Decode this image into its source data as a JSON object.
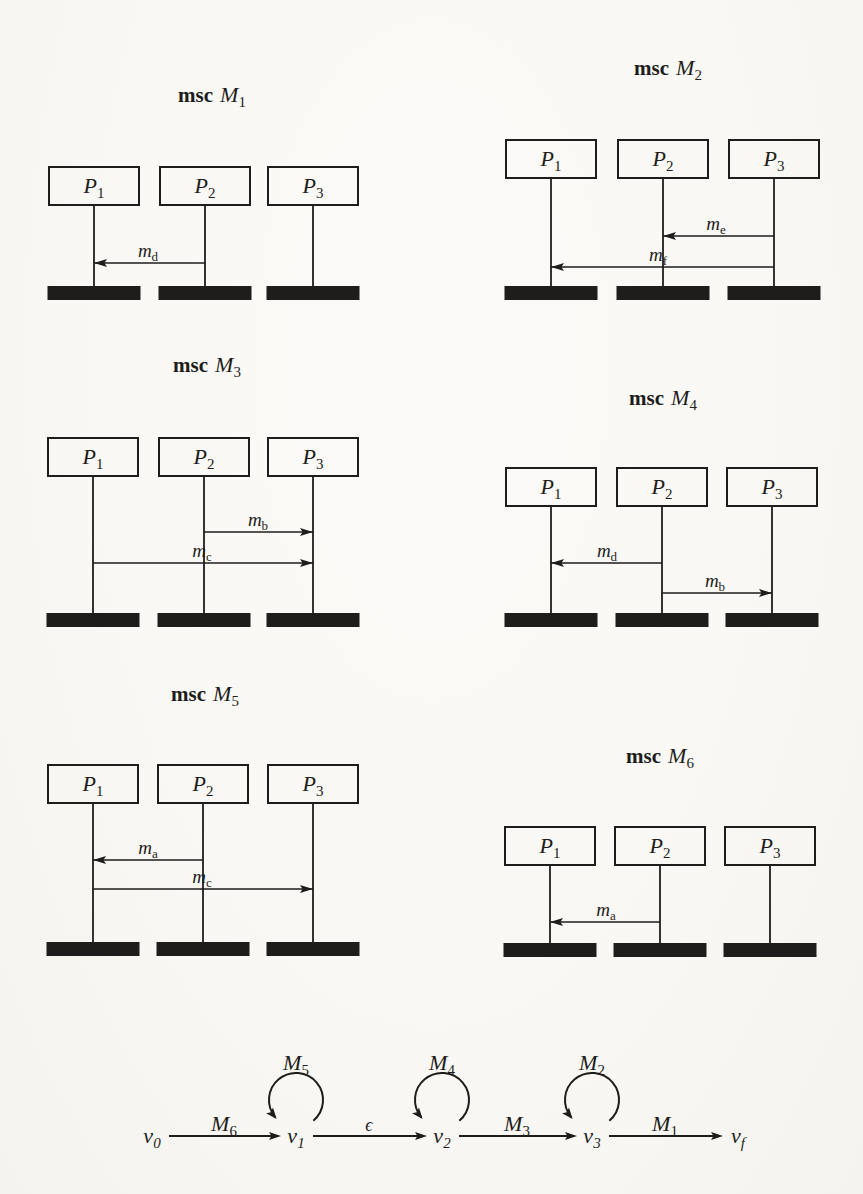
{
  "colors": {
    "ink": "#1e1d1b",
    "paper": "#f9f8f4"
  },
  "panels": [
    {
      "id": "M1",
      "keyword": "msc",
      "name": "M",
      "name_sub": "1",
      "processes": [
        {
          "name": "P",
          "sub": "1"
        },
        {
          "name": "P",
          "sub": "2"
        },
        {
          "name": "P",
          "sub": "3"
        }
      ],
      "messages": [
        {
          "name": "m",
          "sub": "d",
          "from": 1,
          "to": 0
        }
      ]
    },
    {
      "id": "M2",
      "keyword": "msc",
      "name": "M",
      "name_sub": "2",
      "processes": [
        {
          "name": "P",
          "sub": "1"
        },
        {
          "name": "P",
          "sub": "2"
        },
        {
          "name": "P",
          "sub": "3"
        }
      ],
      "messages": [
        {
          "name": "m",
          "sub": "e",
          "from": 2,
          "to": 1
        },
        {
          "name": "m",
          "sub": "f",
          "from": 2,
          "to": 0
        }
      ]
    },
    {
      "id": "M3",
      "keyword": "msc",
      "name": "M",
      "name_sub": "3",
      "processes": [
        {
          "name": "P",
          "sub": "1"
        },
        {
          "name": "P",
          "sub": "2"
        },
        {
          "name": "P",
          "sub": "3"
        }
      ],
      "messages": [
        {
          "name": "m",
          "sub": "b",
          "from": 1,
          "to": 2
        },
        {
          "name": "m",
          "sub": "c",
          "from": 0,
          "to": 2
        }
      ]
    },
    {
      "id": "M4",
      "keyword": "msc",
      "name": "M",
      "name_sub": "4",
      "processes": [
        {
          "name": "P",
          "sub": "1"
        },
        {
          "name": "P",
          "sub": "2"
        },
        {
          "name": "P",
          "sub": "3"
        }
      ],
      "messages": [
        {
          "name": "m",
          "sub": "d",
          "from": 1,
          "to": 0
        },
        {
          "name": "m",
          "sub": "b",
          "from": 1,
          "to": 2
        }
      ]
    },
    {
      "id": "M5",
      "keyword": "msc",
      "name": "M",
      "name_sub": "5",
      "processes": [
        {
          "name": "P",
          "sub": "1"
        },
        {
          "name": "P",
          "sub": "2"
        },
        {
          "name": "P",
          "sub": "3"
        }
      ],
      "messages": [
        {
          "name": "m",
          "sub": "a",
          "from": 1,
          "to": 0
        },
        {
          "name": "m",
          "sub": "c",
          "from": 0,
          "to": 2
        }
      ]
    },
    {
      "id": "M6",
      "keyword": "msc",
      "name": "M",
      "name_sub": "6",
      "processes": [
        {
          "name": "P",
          "sub": "1"
        },
        {
          "name": "P",
          "sub": "2"
        },
        {
          "name": "P",
          "sub": "3"
        }
      ],
      "messages": [
        {
          "name": "m",
          "sub": "a",
          "from": 1,
          "to": 0
        }
      ]
    }
  ],
  "automaton": {
    "states": [
      {
        "name": "v",
        "sub": "0"
      },
      {
        "name": "v",
        "sub": "1"
      },
      {
        "name": "v",
        "sub": "2"
      },
      {
        "name": "v",
        "sub": "3"
      },
      {
        "name": "v",
        "sub": "f"
      }
    ],
    "transitions": [
      {
        "from": 0,
        "to": 1,
        "label": "M",
        "sub": "6"
      },
      {
        "from": 1,
        "to": 2,
        "label": "ϵ",
        "sub": ""
      },
      {
        "from": 2,
        "to": 3,
        "label": "M",
        "sub": "3"
      },
      {
        "from": 3,
        "to": 4,
        "label": "M",
        "sub": "1"
      }
    ],
    "self_loops": [
      {
        "state": 1,
        "label": "M",
        "sub": "5"
      },
      {
        "state": 2,
        "label": "M",
        "sub": "4"
      },
      {
        "state": 3,
        "label": "M",
        "sub": "2"
      }
    ]
  }
}
